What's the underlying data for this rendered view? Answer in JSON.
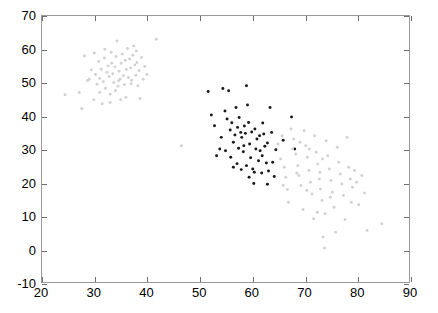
{
  "chart_data": {
    "type": "scatter",
    "title": "",
    "xlabel": "",
    "ylabel": "",
    "xlim": [
      20,
      90
    ],
    "ylim": [
      -10,
      70
    ],
    "xticks": [
      20,
      30,
      40,
      50,
      60,
      70,
      80,
      90
    ],
    "yticks": [
      -10,
      0,
      10,
      20,
      30,
      40,
      50,
      60,
      70
    ],
    "xtick_labels": [
      "20",
      "30",
      "40",
      "50",
      "60",
      "70",
      "80",
      "90"
    ],
    "ytick_labels": [
      "-10",
      "0",
      "10",
      "20",
      "30",
      "40",
      "50",
      "60",
      "70"
    ],
    "grid": false,
    "legend": "none",
    "marker": "dot",
    "marker_size": 3,
    "series": [
      {
        "name": "cluster-upper-left",
        "color": "#d2d2d2",
        "points": [
          [
            24.4,
            46.3
          ],
          [
            27.6,
            42.2
          ],
          [
            28.1,
            58.0
          ],
          [
            27.1,
            47.0
          ],
          [
            28.7,
            50.6
          ],
          [
            29.4,
            53.8
          ],
          [
            29.9,
            44.8
          ],
          [
            30.2,
            52.4
          ],
          [
            30.5,
            49.5
          ],
          [
            30.8,
            56.3
          ],
          [
            31.0,
            51.2
          ],
          [
            31.3,
            54.0
          ],
          [
            31.5,
            43.6
          ],
          [
            31.7,
            50.2
          ],
          [
            31.9,
            57.4
          ],
          [
            32.1,
            48.3
          ],
          [
            32.4,
            53.1
          ],
          [
            32.6,
            55.0
          ],
          [
            32.8,
            51.8
          ],
          [
            33.0,
            46.5
          ],
          [
            33.2,
            59.1
          ],
          [
            33.5,
            52.6
          ],
          [
            33.7,
            50.0
          ],
          [
            33.9,
            54.7
          ],
          [
            34.1,
            57.8
          ],
          [
            34.3,
            62.5
          ],
          [
            34.5,
            48.9
          ],
          [
            34.7,
            53.4
          ],
          [
            34.9,
            51.0
          ],
          [
            35.1,
            55.8
          ],
          [
            35.3,
            58.6
          ],
          [
            35.5,
            52.0
          ],
          [
            35.7,
            49.4
          ],
          [
            35.9,
            56.7
          ],
          [
            36.1,
            53.9
          ],
          [
            36.3,
            60.2
          ],
          [
            36.5,
            51.5
          ],
          [
            36.7,
            57.1
          ],
          [
            36.9,
            54.4
          ],
          [
            37.1,
            50.7
          ],
          [
            37.3,
            58.2
          ],
          [
            37.5,
            61.0
          ],
          [
            37.7,
            55.3
          ],
          [
            37.9,
            52.2
          ],
          [
            38.1,
            56.0
          ],
          [
            38.3,
            49.0
          ],
          [
            38.5,
            53.6
          ],
          [
            38.7,
            45.2
          ],
          [
            39.0,
            57.5
          ],
          [
            39.3,
            51.0
          ],
          [
            39.6,
            54.8
          ],
          [
            40.0,
            52.4
          ],
          [
            41.8,
            63.0
          ],
          [
            30.0,
            58.9
          ],
          [
            32.0,
            60.0
          ],
          [
            33.0,
            44.0
          ],
          [
            29.0,
            51.0
          ],
          [
            34.0,
            47.5
          ],
          [
            36.0,
            45.5
          ],
          [
            35.0,
            44.8
          ],
          [
            31.0,
            47.0
          ],
          [
            37.0,
            49.6
          ],
          [
            38.0,
            59.5
          ],
          [
            34.6,
            50.5
          ],
          [
            33.3,
            55.8
          ],
          [
            46.6,
            31.0
          ]
        ]
      },
      {
        "name": "cluster-middle",
        "color": "#1a1a1a",
        "points": [
          [
            51.7,
            47.3
          ],
          [
            52.3,
            40.2
          ],
          [
            52.9,
            37.0
          ],
          [
            53.3,
            28.0
          ],
          [
            54.5,
            48.2
          ],
          [
            54.9,
            41.4
          ],
          [
            55.3,
            39.0
          ],
          [
            55.6,
            47.5
          ],
          [
            55.9,
            35.7
          ],
          [
            56.2,
            37.9
          ],
          [
            56.5,
            32.0
          ],
          [
            56.8,
            34.2
          ],
          [
            57.0,
            42.5
          ],
          [
            57.3,
            36.5
          ],
          [
            57.6,
            39.5
          ],
          [
            57.9,
            35.0
          ],
          [
            58.1,
            33.5
          ],
          [
            58.4,
            29.2
          ],
          [
            58.6,
            36.9
          ],
          [
            58.8,
            34.7
          ],
          [
            59.0,
            49.0
          ],
          [
            59.2,
            43.2
          ],
          [
            59.4,
            38.0
          ],
          [
            59.6,
            31.5
          ],
          [
            59.8,
            27.4
          ],
          [
            60.0,
            35.1
          ],
          [
            60.2,
            24.0
          ],
          [
            60.4,
            19.6
          ],
          [
            60.6,
            36.0
          ],
          [
            60.8,
            30.0
          ],
          [
            61.0,
            33.0
          ],
          [
            61.3,
            26.5
          ],
          [
            61.6,
            29.5
          ],
          [
            61.9,
            22.8
          ],
          [
            62.1,
            37.8
          ],
          [
            62.3,
            34.5
          ],
          [
            62.5,
            30.8
          ],
          [
            62.8,
            25.8
          ],
          [
            63.0,
            19.4
          ],
          [
            63.2,
            23.4
          ],
          [
            63.5,
            42.5
          ],
          [
            63.8,
            35.0
          ],
          [
            64.0,
            26.0
          ],
          [
            64.3,
            21.7
          ],
          [
            64.6,
            29.8
          ],
          [
            66.0,
            32.6
          ],
          [
            67.6,
            39.6
          ],
          [
            68.2,
            30.0
          ],
          [
            53.9,
            30.0
          ],
          [
            54.2,
            33.5
          ],
          [
            57.2,
            25.6
          ],
          [
            58.0,
            23.8
          ],
          [
            59.5,
            21.5
          ],
          [
            55.0,
            29.5
          ],
          [
            56.0,
            27.5
          ],
          [
            62.0,
            28.0
          ],
          [
            60.5,
            23.0
          ],
          [
            63.0,
            31.8
          ],
          [
            61.5,
            34.0
          ],
          [
            58.5,
            31.0
          ],
          [
            57.5,
            30.2
          ],
          [
            56.5,
            24.5
          ],
          [
            59.0,
            25.0
          ]
        ]
      },
      {
        "name": "cluster-lower-right",
        "color": "#d2d2d2",
        "points": [
          [
            65.0,
            31.5
          ],
          [
            65.5,
            27.0
          ],
          [
            66.2,
            24.5
          ],
          [
            66.5,
            21.5
          ],
          [
            66.8,
            17.8
          ],
          [
            67.0,
            14.0
          ],
          [
            67.5,
            36.0
          ],
          [
            68.0,
            33.0
          ],
          [
            68.4,
            28.5
          ],
          [
            68.8,
            25.0
          ],
          [
            69.0,
            22.0
          ],
          [
            69.4,
            19.0
          ],
          [
            69.8,
            11.8
          ],
          [
            70.0,
            35.5
          ],
          [
            70.3,
            31.0
          ],
          [
            70.6,
            27.5
          ],
          [
            70.9,
            23.5
          ],
          [
            71.2,
            20.0
          ],
          [
            71.5,
            16.5
          ],
          [
            71.8,
            9.0
          ],
          [
            72.0,
            34.0
          ],
          [
            72.3,
            29.0
          ],
          [
            72.6,
            25.5
          ],
          [
            72.9,
            21.0
          ],
          [
            73.1,
            18.0
          ],
          [
            73.4,
            14.5
          ],
          [
            73.6,
            3.5
          ],
          [
            73.9,
            0.2
          ],
          [
            74.2,
            32.5
          ],
          [
            74.5,
            28.0
          ],
          [
            74.8,
            24.0
          ],
          [
            75.1,
            20.5
          ],
          [
            75.4,
            17.0
          ],
          [
            75.7,
            12.5
          ],
          [
            76.0,
            5.0
          ],
          [
            76.3,
            30.5
          ],
          [
            76.6,
            26.0
          ],
          [
            76.9,
            22.5
          ],
          [
            77.2,
            19.5
          ],
          [
            77.5,
            16.0
          ],
          [
            77.8,
            8.8
          ],
          [
            78.2,
            33.5
          ],
          [
            78.5,
            24.5
          ],
          [
            78.8,
            21.0
          ],
          [
            79.2,
            18.5
          ],
          [
            79.6,
            23.5
          ],
          [
            80.0,
            20.0
          ],
          [
            80.4,
            13.2
          ],
          [
            81.0,
            22.0
          ],
          [
            81.5,
            16.8
          ],
          [
            82.0,
            5.5
          ],
          [
            84.8,
            7.5
          ],
          [
            67.8,
            30.0
          ],
          [
            69.2,
            32.0
          ],
          [
            71.0,
            30.0
          ],
          [
            73.0,
            23.0
          ],
          [
            75.0,
            15.5
          ],
          [
            70.5,
            17.5
          ],
          [
            68.6,
            22.8
          ],
          [
            72.5,
            11.0
          ],
          [
            74.0,
            10.5
          ],
          [
            79.0,
            14.0
          ],
          [
            66.0,
            19.0
          ],
          [
            65.8,
            34.0
          ],
          [
            73.5,
            27.0
          ]
        ]
      }
    ]
  }
}
